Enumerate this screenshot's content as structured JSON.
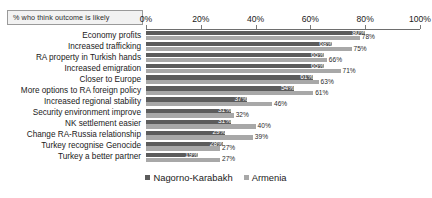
{
  "chart_data": {
    "type": "bar",
    "orientation": "horizontal",
    "title": "% who think outcome is likely",
    "xlabel": "",
    "ylabel": "",
    "xlim": [
      0,
      100
    ],
    "xticks": [
      0,
      20,
      40,
      60,
      80,
      100
    ],
    "xtick_labels": [
      "0%",
      "20%",
      "40%",
      "60%",
      "80%",
      "100%"
    ],
    "grid": false,
    "legend_position": "bottom",
    "categories": [
      "Economy profits",
      "Increased trafficking",
      "RA property in Turkish hands",
      "Increased emigration",
      "Closer to Europe",
      "More options to RA foreign policy",
      "Increased regional stability",
      "Security environment improve",
      "NK settlement easier",
      "Change RA-Russia relationship",
      "Turkey recognise Genocide",
      "Turkey a better partner"
    ],
    "series": [
      {
        "name": "Nagorno-Karabakh",
        "color": "#5c5c5c",
        "values": [
          80,
          68,
          65,
          65,
          61,
          54,
          37,
          31,
          31,
          29,
          28,
          19
        ],
        "labels": [
          "80%",
          "68%",
          "65%",
          "65%",
          "61%",
          "54%",
          "37%",
          "31%",
          "31%",
          "29%",
          "28%",
          "19%"
        ]
      },
      {
        "name": "Armenia",
        "color": "#a8a8a8",
        "values": [
          78,
          75,
          66,
          71,
          63,
          61,
          46,
          32,
          40,
          39,
          27,
          27
        ],
        "labels": [
          "78%",
          "75%",
          "66%",
          "71%",
          "63%",
          "61%",
          "46%",
          "32%",
          "40%",
          "39%",
          "27%",
          "27%"
        ]
      }
    ]
  },
  "legend": {
    "items": [
      {
        "label": "Nagorno-Karabakh",
        "color": "#5c5c5c"
      },
      {
        "label": "Armenia",
        "color": "#a8a8a8"
      }
    ]
  }
}
